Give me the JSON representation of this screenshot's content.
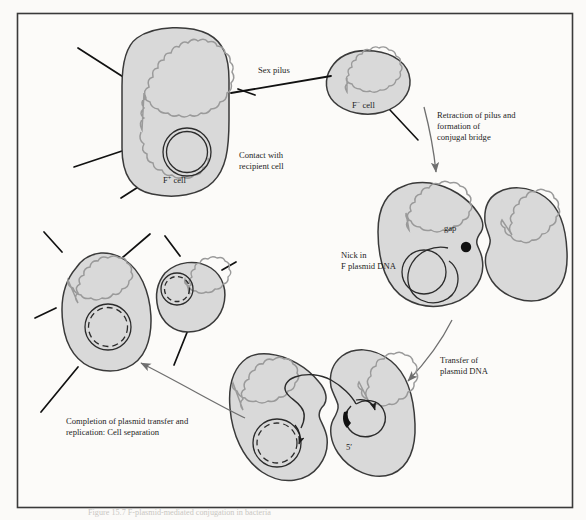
{
  "figure": {
    "caption_partial": "Figure  15.7    F-plasmid-mediated conjugation in bacteria",
    "frame": {
      "x": 17,
      "y": 13,
      "width": 556,
      "height": 495,
      "border_color": "#3a3a3a",
      "background": "#fbfaf8"
    }
  },
  "colors": {
    "cell_fill": "#d9d9d9",
    "cell_stroke": "#3a3a3a",
    "chromosome": "#9a9a9a",
    "plasmid": "#2b2b2b",
    "pilus": "#111111",
    "nick_dot": "#111111",
    "arrow": "#6f6f6f",
    "text": "#1d1d1d"
  },
  "labels": {
    "sex_pilus": "Sex pilus",
    "f_minus_cell": {
      "symbol": "F",
      "superscript": "−",
      "suffix": " cell",
      "full": "F− cell"
    },
    "f_plus_cell": {
      "symbol": "F",
      "superscript": "+",
      "suffix": " cell",
      "full": "F+ cell"
    },
    "contact_with_recipient": {
      "line1": "Contact with",
      "line2": "recipient cell"
    },
    "retraction": {
      "line1": "Retraction of pilus and",
      "line2": "formation of",
      "line3": "conjugal bridge"
    },
    "gap": "gap",
    "nick_in_f_plasmid": {
      "line1": "Nick in",
      "line2": "F plasmid DNA"
    },
    "transfer": {
      "line1": "Transfer of",
      "line2": "plasmid DNA"
    },
    "completion": {
      "line1": "Completion of plasmid transfer and",
      "line2": "replication:  Cell separation"
    },
    "five_prime": {
      "digit": "5",
      "prime": "′",
      "full": "5′"
    }
  },
  "stages": [
    {
      "id": "stage-1-donor-recipient-contact",
      "name": "F+ donor contacts F− recipient via sex pilus",
      "cells": [
        {
          "role": "donor",
          "label": "F+ cell",
          "has_chromosome": true,
          "has_plasmid": true,
          "pili_count": 5
        },
        {
          "role": "recipient",
          "label": "F− cell",
          "has_chromosome": true,
          "has_plasmid": false,
          "pili_count": 1
        }
      ]
    },
    {
      "id": "stage-2-conjugal-bridge-nick",
      "name": "Pilus retracts, conjugal bridge forms, plasmid is nicked",
      "cells": [
        {
          "role": "donor",
          "has_chromosome": true,
          "has_plasmid": true,
          "nick": true
        },
        {
          "role": "recipient",
          "has_chromosome": true,
          "has_plasmid": false
        }
      ]
    },
    {
      "id": "stage-3-plasmid-transfer",
      "name": "Single strand of plasmid DNA transfers through the bridge",
      "cells": [
        {
          "role": "donor",
          "has_chromosome": true,
          "has_plasmid": true,
          "replicating": true
        },
        {
          "role": "recipient",
          "has_chromosome": true,
          "has_plasmid": true,
          "five_prime_end": true
        }
      ]
    },
    {
      "id": "stage-4-separation",
      "name": "Replication completes; cells separate, both now F+",
      "cells": [
        {
          "role": "former-donor",
          "has_chromosome": true,
          "has_plasmid": true,
          "pili_count": 4
        },
        {
          "role": "former-recipient",
          "has_chromosome": true,
          "has_plasmid": true,
          "pili_count": 3
        }
      ]
    }
  ],
  "flow_arrows": [
    {
      "from": "stage-1-donor-recipient-contact",
      "to": "stage-2-conjugal-bridge-nick",
      "label": "Retraction of pilus and formation of conjugal bridge"
    },
    {
      "from": "stage-2-conjugal-bridge-nick",
      "to": "stage-3-plasmid-transfer",
      "label": "Transfer of plasmid DNA"
    },
    {
      "from": "stage-3-plasmid-transfer",
      "to": "stage-4-separation",
      "label": "Completion of plasmid transfer and replication:  Cell separation"
    }
  ]
}
